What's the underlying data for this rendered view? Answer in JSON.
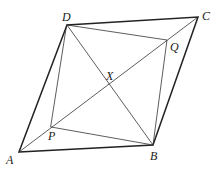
{
  "diagram": {
    "type": "geometry",
    "points": {
      "A": {
        "x": 19,
        "y": 152,
        "label": "A",
        "lx": 6,
        "ly": 164
      },
      "B": {
        "x": 153,
        "y": 145,
        "label": "B",
        "lx": 150,
        "ly": 160
      },
      "C": {
        "x": 198,
        "y": 17,
        "label": "C",
        "lx": 202,
        "ly": 20
      },
      "D": {
        "x": 67,
        "y": 25,
        "label": "D",
        "lx": 62,
        "ly": 21
      },
      "X": {
        "x": 109,
        "y": 86,
        "label": "X",
        "lx": 106,
        "ly": 80
      },
      "P": {
        "x": 51,
        "y": 127,
        "label": "P",
        "lx": 48,
        "ly": 140
      },
      "Q": {
        "x": 167,
        "y": 40,
        "label": "Q",
        "lx": 170,
        "ly": 51
      }
    },
    "outer_quadrilateral": [
      "A",
      "B",
      "C",
      "D"
    ],
    "inner_quadrilateral": [
      "P",
      "B",
      "Q",
      "D"
    ],
    "diagonals": [
      [
        "A",
        "C"
      ],
      [
        "D",
        "B"
      ]
    ],
    "extra_segments": [
      [
        "A",
        "P"
      ]
    ]
  }
}
